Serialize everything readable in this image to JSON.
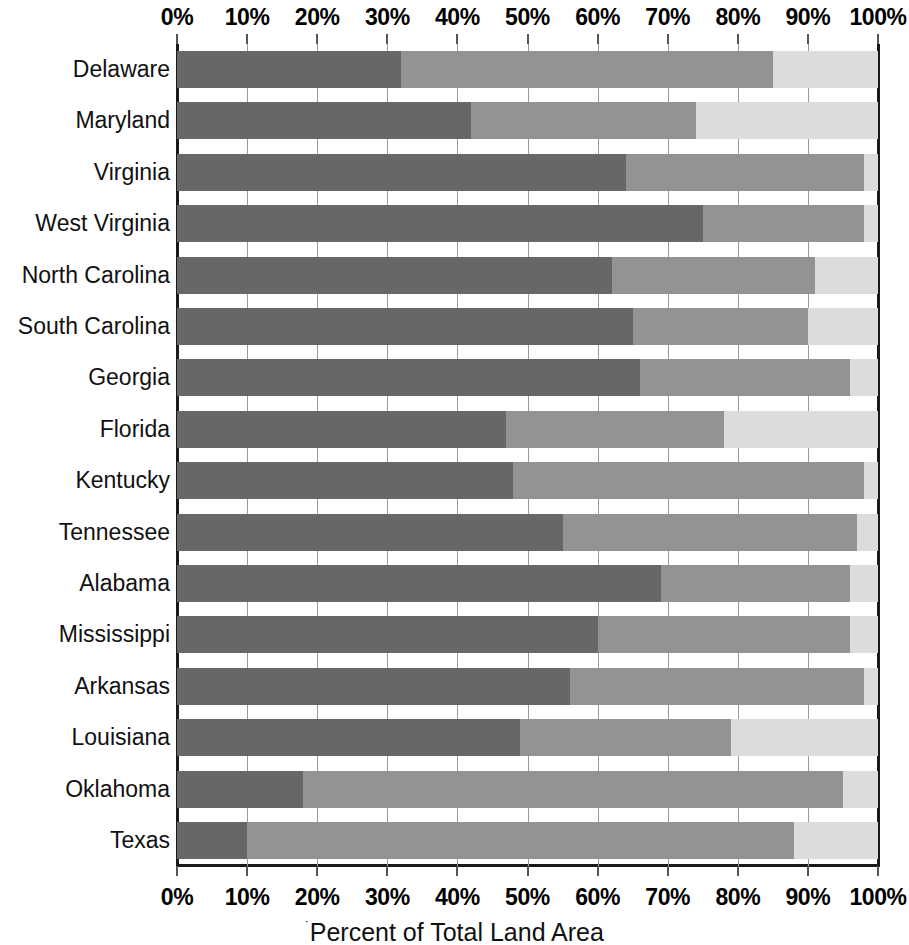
{
  "figure": {
    "caption": "Percent of Total Land Area",
    "caption_prefix_mark": "˙"
  },
  "chart_data": {
    "type": "bar",
    "subtype": "stacked-horizontal-100pct",
    "title": "",
    "xlabel": "Percent of Total Land Area",
    "ylabel": "",
    "xlim": [
      0,
      100
    ],
    "xtick_labels": [
      "0%",
      "10%",
      "20%",
      "30%",
      "40%",
      "50%",
      "60%",
      "70%",
      "80%",
      "90%",
      "100%"
    ],
    "xticks": [
      0,
      10,
      20,
      30,
      40,
      50,
      60,
      70,
      80,
      90,
      100
    ],
    "grid": true,
    "grid_axis": "x",
    "axis_top": true,
    "axis_bottom": true,
    "legend": false,
    "legend_position": "none",
    "categories": [
      "Delaware",
      "Maryland",
      "Virginia",
      "West Virginia",
      "North Carolina",
      "South Carolina",
      "Georgia",
      "Florida",
      "Kentucky",
      "Tennessee",
      "Alabama",
      "Mississippi",
      "Arkansas",
      "Louisiana",
      "Oklahoma",
      "Texas"
    ],
    "series": [
      {
        "name": "series-1",
        "color": "#676767",
        "values": [
          32,
          42,
          64,
          75,
          62,
          65,
          66,
          47,
          48,
          55,
          69,
          60,
          56,
          49,
          18,
          10
        ]
      },
      {
        "name": "series-2",
        "color": "#939393",
        "values": [
          53,
          32,
          34,
          23,
          29,
          25,
          30,
          31,
          50,
          42,
          27,
          36,
          42,
          30,
          77,
          78
        ]
      },
      {
        "name": "series-3",
        "color": "#dcdcdc",
        "values": [
          15,
          26,
          2,
          2,
          9,
          10,
          4,
          22,
          2,
          3,
          4,
          4,
          2,
          21,
          5,
          12
        ]
      }
    ],
    "stacked_totals": [
      100,
      100,
      100,
      100,
      100,
      100,
      100,
      100,
      100,
      100,
      100,
      100,
      100,
      100,
      100,
      100
    ]
  }
}
